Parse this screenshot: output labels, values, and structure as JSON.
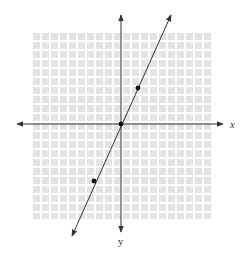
{
  "figure": {
    "type": "coordinate-plane-line-graph",
    "axes": {
      "x_label": "x",
      "y_label": "y",
      "x_range": [
        -10,
        10
      ],
      "y_range": [
        -10,
        10
      ]
    },
    "grid": {
      "visible": true,
      "cell_size_px": 9,
      "color": "#e3e3e3",
      "gap_color": "#ffffff"
    },
    "line": {
      "equation": "y = 2x",
      "slope": 2,
      "intercept": 0,
      "color": "#333333",
      "arrowheads": "both"
    },
    "points": [
      {
        "label": "P1",
        "x": 2,
        "y": 4
      },
      {
        "label": "origin",
        "x": 0,
        "y": 0
      },
      {
        "label": "P2",
        "x": -3,
        "y": -6
      }
    ],
    "colors": {
      "axis": "#333333",
      "point": "#111111"
    }
  }
}
